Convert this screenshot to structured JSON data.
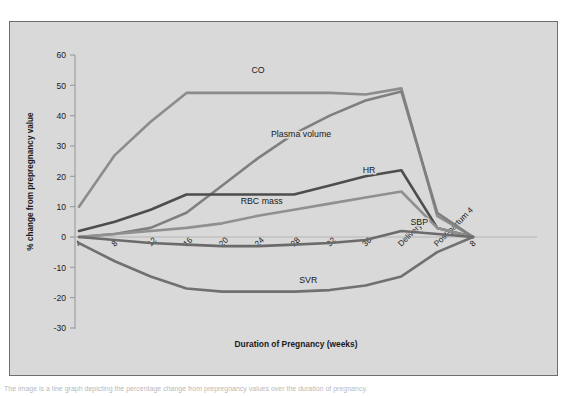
{
  "figure": {
    "background_color": "#d9d9d9",
    "border_color": "#6e6e6e",
    "caption": "The image is a line graph depicting the percentage change from prepregnancy values over the duration of pregnancy."
  },
  "chart_data": {
    "type": "line",
    "title": "",
    "xlabel": "Duration of Pregnancy (weeks)",
    "ylabel": "% change from  prepregnancy value",
    "categories": [
      "4",
      "8",
      "12",
      "16",
      "20",
      "24",
      "28",
      "32",
      "36",
      "Delivery",
      "Post-partum 4",
      "8"
    ],
    "xtick_labels": [
      "4",
      "8",
      "12",
      "16",
      "20",
      "24",
      "28",
      "32",
      "36",
      "Delivery",
      "Post-partum 4",
      "8"
    ],
    "ytick_labels": [
      "60",
      "50",
      "40",
      "30",
      "20",
      "10",
      "0",
      "-10",
      "-20",
      "-30"
    ],
    "ytick_values": [
      60,
      50,
      40,
      30,
      20,
      10,
      0,
      -10,
      -20,
      -30
    ],
    "ylim": [
      -30,
      60
    ],
    "grid": false,
    "legend_position": "inline-labels",
    "series": [
      {
        "name": "CO",
        "label": "CO",
        "color": "#8c8c8c",
        "values": [
          10,
          27,
          38,
          47.5,
          47.5,
          47.5,
          47.5,
          47.5,
          47,
          49,
          7,
          0
        ],
        "label_x_index": 5.0,
        "label_y": 54
      },
      {
        "name": "Plasma volume",
        "label": "Plasma volume",
        "color": "#7f7f7f",
        "values": [
          0,
          1,
          3,
          8,
          17,
          26,
          34,
          40,
          45,
          48,
          8,
          0
        ],
        "label_x_index": 6.2,
        "label_y": 33
      },
      {
        "name": "HR",
        "label": "HR",
        "color": "#4d4d4d",
        "values": [
          2,
          5,
          9,
          14,
          14,
          14,
          14,
          17,
          20,
          22,
          3,
          0
        ],
        "label_x_index": 8.1,
        "label_y": 21
      },
      {
        "name": "RBC mass",
        "label": "RBC mass",
        "color": "#909090",
        "values": [
          0,
          1,
          2,
          3,
          4.5,
          7,
          9,
          11,
          13,
          15,
          3,
          0
        ],
        "label_x_index": 5.1,
        "label_y": 11
      },
      {
        "name": "SBP",
        "label": "SBP",
        "color": "#6b6b6b",
        "values": [
          0,
          -1,
          -2,
          -2.5,
          -3,
          -3,
          -2.5,
          -2,
          -1,
          2,
          1,
          0
        ],
        "label_x_index": 9.5,
        "label_y": 4
      },
      {
        "name": "SVR",
        "label": "SVR",
        "color": "#707070",
        "values": [
          -2,
          -8,
          -13,
          -17,
          -18,
          -18,
          -18,
          -17.5,
          -16,
          -13,
          -5,
          0
        ],
        "label_x_index": 6.4,
        "label_y": -15
      }
    ]
  }
}
